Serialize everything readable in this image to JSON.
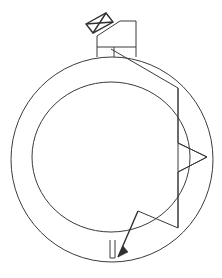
{
  "document": {
    "title": "Technical Line Diagram",
    "kind": "engineering-line-drawing",
    "background_color": "#ffffff",
    "stroke_color": "#3a3a3a",
    "width": 222,
    "height": 278
  },
  "shapes": {
    "outer_ring": {
      "name": "outer-circle",
      "cx": 112,
      "cy": 159.5,
      "rx": 101,
      "ry": 102.5,
      "stroke": "#3a3a3a"
    },
    "inner_ring": {
      "name": "inner-circle",
      "cx": 111,
      "cy": 157,
      "rx": 79,
      "ry": 75,
      "stroke": "#3a3a3a"
    },
    "top_box": {
      "name": "mounting-box",
      "outline": "97,57 97,36 120,21 136,21 136,57",
      "divider": "97,47 136,47",
      "stem": "114,47 114,57",
      "stroke": "#3a3a3a"
    },
    "envelope": {
      "name": "envelope-flap",
      "outline": "86,24 106,13 113,22 93,33",
      "diagonal_a": "86,24 113,22",
      "diagonal_b": "106,13 93,33",
      "stroke": "#2f2f2f"
    },
    "leader_polygon": {
      "name": "right-leader-polygon",
      "points": "111,49 178,88 178,143 207,157 178,172 178,228 138,211",
      "stroke": "#3a3a3a"
    },
    "polygon_chords": [
      {
        "name": "chord-upper",
        "points": "178,88 178,143"
      },
      {
        "name": "chord-lower",
        "points": "178,172 178,228"
      },
      {
        "name": "arrow-wedge-upper",
        "points": "178,143 207,157"
      },
      {
        "name": "arrow-wedge-lower",
        "points": "207,157 178,172"
      },
      {
        "name": "wedge-back",
        "points": "178,143 178,172"
      }
    ],
    "bottom_arrow": {
      "name": "bottom-callout-arrow",
      "shaft": "138,211 118,257",
      "head": "118,257 123,246 128,252",
      "stroke": "#2f2f2f"
    },
    "bottom_notch": {
      "name": "ring-notch-slot",
      "outline": "110,240 110,258 115,258 115,240",
      "stroke": "#3a3a3a"
    }
  },
  "labels": {
    "caption": "",
    "figure_number": ""
  }
}
